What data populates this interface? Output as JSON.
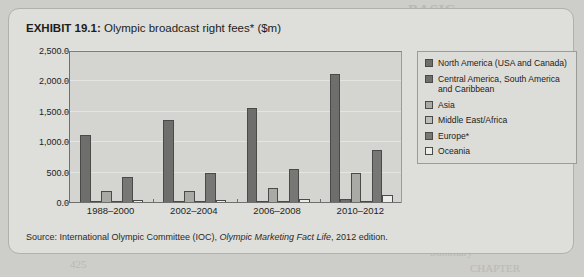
{
  "exhibit": {
    "number": "EXHIBIT 19.1:",
    "title": "Olympic broadcast right fees* ($m)",
    "source_prefix": "Source: International Olympic Committee (IOC), ",
    "source_italic": "Olympic Marketing Fact Life",
    "source_suffix": ", 2012 edition."
  },
  "chart_data": {
    "type": "bar",
    "title": "Olympic broadcast right fees* ($m)",
    "xlabel": "",
    "ylabel": "",
    "ylim": [
      0,
      2500
    ],
    "ytick_labels": [
      "2,500.0",
      "2,000.0",
      "1,500.0",
      "1,000.0",
      "500.0",
      "0.0"
    ],
    "ytick_values": [
      2500,
      2000,
      1500,
      1000,
      500,
      0
    ],
    "grid": true,
    "legend_position": "right",
    "categories": [
      "1988–2000",
      "2002–2004",
      "2006–2008",
      "2010–2012"
    ],
    "series": [
      {
        "name": "North America (USA and Canada)",
        "color": "#6e6e6c",
        "values": [
          1120,
          1370,
          1560,
          2130
        ]
      },
      {
        "name": "Central America, South America and Caribbean",
        "color": "#6e6e6c",
        "values": [
          18,
          15,
          20,
          60
        ]
      },
      {
        "name": "Asia",
        "color": "#a9a9a6",
        "values": [
          190,
          200,
          240,
          500
        ]
      },
      {
        "name": "Middle East/Africa",
        "color": "#bdbdba",
        "values": [
          10,
          10,
          12,
          18
        ]
      },
      {
        "name": "Europe*",
        "color": "#777775",
        "values": [
          420,
          490,
          560,
          870
        ]
      },
      {
        "name": "Oceania",
        "color": "#ececea",
        "values": [
          50,
          45,
          65,
          130
        ]
      }
    ]
  },
  "legend": {
    "items": [
      {
        "label": "North America (USA and Canada)",
        "color": "#6e6e6c"
      },
      {
        "label": "Central America, South America and Caribbean",
        "color": "#6e6e6c"
      },
      {
        "label": "Asia",
        "color": "#a9a9a6"
      },
      {
        "label": "Middle East/Africa",
        "color": "#bdbdba"
      },
      {
        "label": "Europe*",
        "color": "#777775"
      },
      {
        "label": "Oceania",
        "color": "#ececea"
      }
    ]
  },
  "background_ghost_text": [
    {
      "text": "BASIC",
      "x": 408,
      "y": 2,
      "big": true
    },
    {
      "text": "International",
      "x": 430,
      "y": 110
    },
    {
      "text": "Challenges of internation",
      "x": 415,
      "y": 125
    },
    {
      "text": "Media pla",
      "x": 452,
      "y": 140
    },
    {
      "text": "Sales promotion",
      "x": 440,
      "y": 155
    },
    {
      "text": "The gro",
      "x": 452,
      "y": 170
    },
    {
      "text": "International control of",
      "x": 424,
      "y": 185
    },
    {
      "text": "425",
      "x": 70,
      "y": 258
    },
    {
      "text": "Summary",
      "x": 430,
      "y": 246
    },
    {
      "text": "CHAPTER",
      "x": 470,
      "y": 262
    }
  ]
}
